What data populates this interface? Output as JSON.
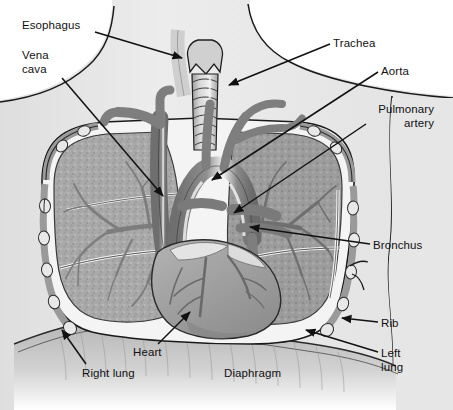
{
  "figure": {
    "style": "grayscale pen-and-ink medical illustration",
    "background_color": "#ffffff",
    "ink_color": "#111111",
    "palette": {
      "body_silhouette": "#e9e9e9",
      "body_silhouette_shadow": "#d6d6d6",
      "lung_tissue": "#a8a8a8",
      "lung_tissue_dark": "#8f8f8f",
      "vessel_gray": "#8a8a8a",
      "vessel_dark": "#6e6e6e",
      "heart_gray": "#9b9b9b",
      "trachea_gray": "#c4c4c4",
      "rib_gray": "#9a9a9a",
      "pleura_white": "#f4f4f4",
      "diaphragm_gray": "#bdbdbd",
      "outline": "#1a1a1a"
    }
  },
  "labels": [
    {
      "id": "esophagus",
      "text": "Esophagus",
      "x": 22,
      "y": 18,
      "align": "left",
      "leader": {
        "x1": 95,
        "y1": 32,
        "x2": 182,
        "y2": 58
      }
    },
    {
      "id": "vena-cava",
      "text": "Vena\ncava",
      "x": 22,
      "y": 48,
      "align": "left",
      "leader": {
        "x1": 62,
        "y1": 78,
        "x2": 163,
        "y2": 196
      }
    },
    {
      "id": "trachea",
      "text": "Trachea",
      "x": 333,
      "y": 36,
      "align": "left",
      "leader": {
        "x1": 330,
        "y1": 44,
        "x2": 229,
        "y2": 85
      }
    },
    {
      "id": "aorta",
      "text": "Aorta",
      "x": 381,
      "y": 64,
      "align": "left",
      "leader": {
        "x1": 378,
        "y1": 72,
        "x2": 212,
        "y2": 180
      }
    },
    {
      "id": "pulmonary-artery",
      "text": "Pulmonary\nartery",
      "x": 368,
      "y": 102,
      "align": "left",
      "leader": {
        "x1": 366,
        "y1": 124,
        "x2": 234,
        "y2": 213
      }
    },
    {
      "id": "bronchus",
      "text": "Bronchus",
      "x": 373,
      "y": 238,
      "align": "left",
      "leader": {
        "x1": 370,
        "y1": 244,
        "x2": 250,
        "y2": 227
      }
    },
    {
      "id": "rib",
      "text": "Rib",
      "x": 381,
      "y": 316,
      "align": "left",
      "leader": {
        "x1": 378,
        "y1": 322,
        "x2": 342,
        "y2": 318
      }
    },
    {
      "id": "left-lung",
      "text": "Left\nlung",
      "x": 381,
      "y": 346,
      "align": "left",
      "leader": {
        "x1": 378,
        "y1": 352,
        "x2": 306,
        "y2": 330
      }
    },
    {
      "id": "heart",
      "text": "Heart",
      "x": 133,
      "y": 345,
      "align": "left",
      "leader": {
        "x1": 158,
        "y1": 344,
        "x2": 190,
        "y2": 312
      }
    },
    {
      "id": "right-lung",
      "text": "Right lung",
      "x": 82,
      "y": 366,
      "align": "left",
      "leader": {
        "x1": 86,
        "y1": 364,
        "x2": 62,
        "y2": 330
      }
    },
    {
      "id": "diaphragm",
      "text": "Diaphragm",
      "x": 224,
      "y": 366,
      "align": "left",
      "leader": null
    }
  ]
}
